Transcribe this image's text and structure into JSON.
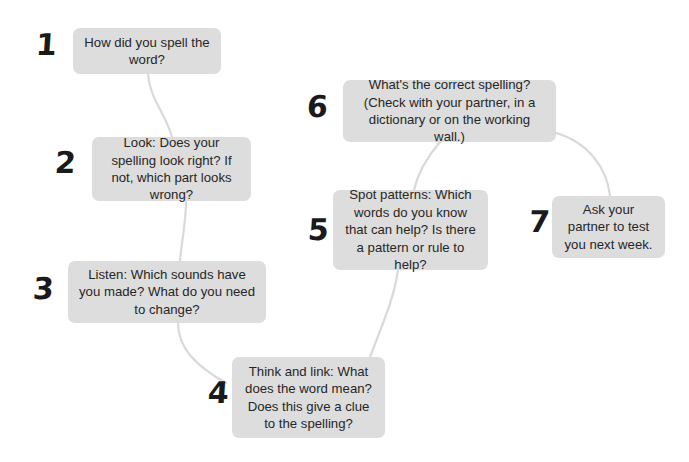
{
  "diagram": {
    "background_color": "#ffffff",
    "box_color": "#dddddd",
    "text_color": "#262626",
    "number_color": "#1a1a1a",
    "connector_color": "#d9d9d9",
    "steps": [
      {
        "number": "1",
        "text": "How did you spell the word?",
        "num_x": 36,
        "num_y": 30,
        "box_x": 73,
        "box_y": 28,
        "box_w": 148,
        "box_h": 46
      },
      {
        "number": "2",
        "text": "Look: Does your spelling look right? If not, which part looks wrong?",
        "num_x": 55,
        "num_y": 148,
        "box_x": 92,
        "box_y": 137,
        "box_w": 159,
        "box_h": 64
      },
      {
        "number": "3",
        "text": "Listen: Which sounds have you made? What do you need to change?",
        "num_x": 33,
        "num_y": 274,
        "box_x": 68,
        "box_y": 261,
        "box_w": 198,
        "box_h": 62
      },
      {
        "number": "4",
        "text": "Think and link: What does the word mean? Does this give a clue to the spelling?",
        "num_x": 208,
        "num_y": 378,
        "box_x": 232,
        "box_y": 357,
        "box_w": 153,
        "box_h": 81
      },
      {
        "number": "5",
        "text": "Spot patterns: Which words do you know that can help? Is there a pattern or rule to help?",
        "num_x": 308,
        "num_y": 215,
        "box_x": 333,
        "box_y": 190,
        "box_w": 155,
        "box_h": 80
      },
      {
        "number": "6",
        "text": "What's the correct spelling? (Check with your partner, in a dictionary or on the working wall.)",
        "num_x": 307,
        "num_y": 92,
        "box_x": 343,
        "box_y": 80,
        "box_w": 213,
        "box_h": 62
      },
      {
        "number": "7",
        "text": "Ask your partner to test you next week.",
        "num_x": 529,
        "num_y": 207,
        "box_x": 552,
        "box_y": 196,
        "box_w": 113,
        "box_h": 62
      }
    ],
    "connectors": [
      {
        "from": "1",
        "to": "2",
        "path": "M 148 74 C 150 100, 165 112, 172 137"
      },
      {
        "from": "2",
        "to": "3",
        "path": "M 186 201 C 186 222, 182 238, 180 261"
      },
      {
        "from": "3",
        "to": "4",
        "path": "M 178 323 C 178 348, 196 366, 226 383"
      },
      {
        "from": "4",
        "to": "5",
        "path": "M 370 357 C 380 330, 394 300, 398 270"
      },
      {
        "from": "5",
        "to": "6",
        "path": "M 414 190 C 418 172, 428 156, 440 142"
      },
      {
        "from": "6",
        "to": "7",
        "path": "M 556 133 C 588 142, 607 168, 610 196"
      }
    ]
  }
}
